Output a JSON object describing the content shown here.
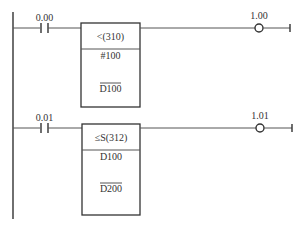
{
  "diagram": {
    "type": "plc-ladder",
    "colors": {
      "line": "#555555",
      "text": "#333333",
      "background": "#ffffff"
    },
    "rungs": [
      {
        "contact": {
          "address": "0.00",
          "type": "normally-open"
        },
        "instruction": {
          "mnemonic": "<(310)",
          "operands": [
            "#100",
            "D100"
          ],
          "operand_overlines": [
            false,
            true
          ]
        },
        "coil": {
          "address": "1.00",
          "type": "output"
        }
      },
      {
        "contact": {
          "address": "0.01",
          "type": "normally-open"
        },
        "instruction": {
          "mnemonic": "≤S(312)",
          "operands": [
            "D100",
            "D200"
          ],
          "operand_overlines": [
            false,
            true
          ]
        },
        "coil": {
          "address": "1.01",
          "type": "output"
        }
      }
    ]
  }
}
